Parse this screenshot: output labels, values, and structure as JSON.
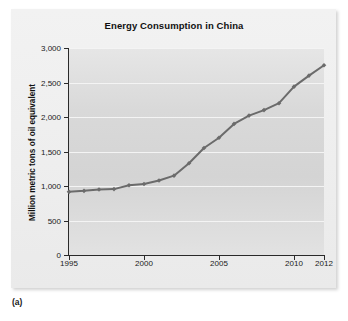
{
  "figure": {
    "caption": "(a)"
  },
  "chart_data": {
    "type": "line",
    "title": "Energy Consumption in China",
    "xlabel": "",
    "ylabel": "Million metric tons of oil equivalent",
    "x": [
      1995,
      1996,
      1997,
      1998,
      1999,
      2000,
      2001,
      2002,
      2003,
      2004,
      2005,
      2006,
      2007,
      2008,
      2009,
      2010,
      2011,
      2012
    ],
    "values": [
      915,
      930,
      950,
      955,
      1010,
      1030,
      1080,
      1150,
      1330,
      1550,
      1700,
      1900,
      2020,
      2100,
      2200,
      2440,
      2600,
      2750
    ],
    "series": [
      {
        "name": "Energy consumption",
        "values": [
          915,
          930,
          950,
          955,
          1010,
          1030,
          1080,
          1150,
          1330,
          1550,
          1700,
          1900,
          2020,
          2100,
          2200,
          2440,
          2600,
          2750
        ]
      }
    ],
    "xlim": [
      1995,
      2012
    ],
    "ylim": [
      0,
      3000
    ],
    "x_tick_values": [
      1995,
      2000,
      2005,
      2010,
      2012
    ],
    "x_tick_labels": [
      "1995",
      "2000",
      "2005",
      "2010",
      "2012"
    ],
    "y_tick_values": [
      0,
      500,
      1000,
      1500,
      2000,
      2500,
      3000
    ],
    "y_tick_labels": [
      "0",
      "500",
      "1,000",
      "1,500",
      "2,000",
      "2,500",
      "3,000"
    ],
    "grid": true,
    "legend": "none",
    "line_color": "#6b6b6b",
    "marker": "diamond",
    "plot_background": "#d9d9d9",
    "panel_background": "#efefef"
  }
}
